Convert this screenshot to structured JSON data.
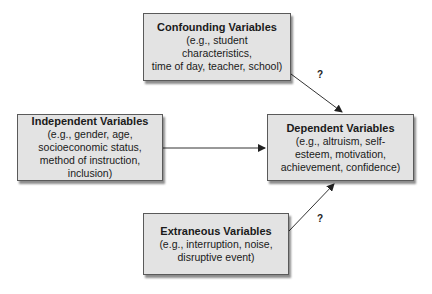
{
  "diagram": {
    "boxes": {
      "confounding": {
        "title": "Confounding Variables",
        "description": "(e.g., student\ncharacteristics,\ntime of day, teacher, school)"
      },
      "independent": {
        "title": "Independent Variables",
        "description": "(e.g., gender, age,\nsocioeconomic status,\nmethod of instruction,\ninclusion)"
      },
      "dependent": {
        "title": "Dependent Variables",
        "description": "(e.g., altruism, self-\nesteem, motivation,\nachievement, confidence)"
      },
      "extraneous": {
        "title": "Extraneous Variables",
        "description": "(e.g., interruption, noise,\ndisruptive event)"
      }
    },
    "arrows": [
      {
        "from": "confounding",
        "to": "dependent",
        "label": "?"
      },
      {
        "from": "independent",
        "to": "dependent",
        "label": ""
      },
      {
        "from": "extraneous",
        "to": "dependent",
        "label": "?"
      }
    ],
    "colors": {
      "box_fill": "#e3e3e3",
      "box_border": "#5a5a5a",
      "arrow": "#333333"
    }
  }
}
